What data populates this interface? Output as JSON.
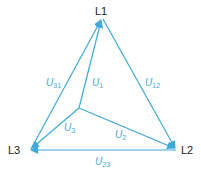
{
  "diagram": {
    "type": "three-phase voltage triangle",
    "line_color": "#3fa9d8",
    "text_color": "#222222",
    "nodes": [
      {
        "id": "L1",
        "label": "L1"
      },
      {
        "id": "L2",
        "label": "L2"
      },
      {
        "id": "L3",
        "label": "L3"
      }
    ],
    "edges": [
      {
        "id": "U12",
        "label": "U",
        "sub": "12",
        "from": "L1",
        "to": "L2"
      },
      {
        "id": "U23",
        "label": "U",
        "sub": "23",
        "from": "L2",
        "to": "L3"
      },
      {
        "id": "U31",
        "label": "U",
        "sub": "31",
        "from": "L3",
        "to": "L1"
      },
      {
        "id": "U1",
        "label": "U",
        "sub": "1",
        "from": "N",
        "to": "L1"
      },
      {
        "id": "U2",
        "label": "U",
        "sub": "2",
        "from": "N",
        "to": "L2"
      },
      {
        "id": "U3",
        "label": "U",
        "sub": "3",
        "from": "N",
        "to": "L3"
      }
    ]
  }
}
